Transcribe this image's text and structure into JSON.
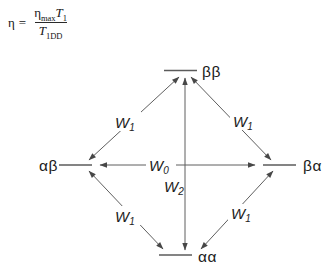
{
  "equation": {
    "lhs": "η",
    "equals": "=",
    "numerator": {
      "eta": "η",
      "eta_sub": "max",
      "T": "T",
      "T_sub": "1"
    },
    "denominator": {
      "T": "T",
      "T_sub": "1DD"
    }
  },
  "diagram": {
    "states": {
      "top": "ββ",
      "left": "αβ",
      "right": "βα",
      "bottom": "αα"
    },
    "transitions": {
      "w0": {
        "symbol": "W",
        "sub": "0"
      },
      "w2": {
        "symbol": "W",
        "sub": "2"
      },
      "w1_upper_left": {
        "symbol": "W",
        "sub": "1"
      },
      "w1_upper_right": {
        "symbol": "W",
        "sub": "1"
      },
      "w1_lower_left": {
        "symbol": "W",
        "sub": "1"
      },
      "w1_lower_right": {
        "symbol": "W",
        "sub": "1"
      }
    },
    "colors": {
      "line": "#5b5b5b",
      "text": "#1a1a1a",
      "background": "#ffffff"
    }
  }
}
